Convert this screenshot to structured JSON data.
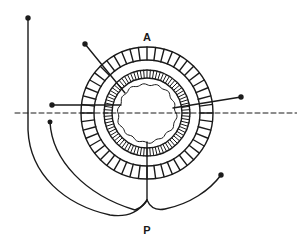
{
  "figure": {
    "type": "schematic cross-section diagram",
    "labels": [
      {
        "id": "anterior",
        "text": "A",
        "x": 147,
        "y": 37
      },
      {
        "id": "posterior",
        "text": "P",
        "x": 147,
        "y": 230
      }
    ],
    "colors": {
      "ink": "#1a1a1a",
      "background": "#ffffff"
    },
    "center": {
      "x": 147,
      "y": 113
    },
    "rings": [
      {
        "id": "outer-ring",
        "r_outer": 66,
        "r_inner": 53,
        "segments": 48
      },
      {
        "id": "inner-ring",
        "r_outer": 43,
        "r_inner": 35,
        "segments": 80
      },
      {
        "id": "core",
        "r": 29,
        "style": "wavy"
      }
    ],
    "axis_line": {
      "style": "dashed",
      "y": 113,
      "x1": 15,
      "x2": 297
    }
  }
}
